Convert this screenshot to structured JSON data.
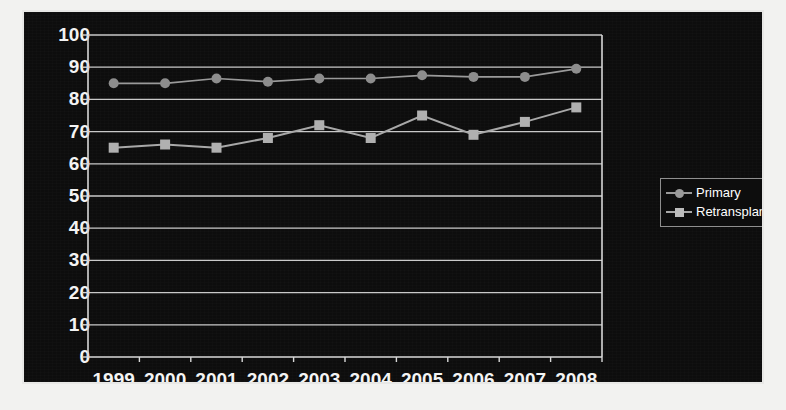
{
  "chart_data": {
    "type": "line",
    "title": "",
    "subtitle": "",
    "xlabel": "",
    "ylabel": "",
    "categories": [
      "1999",
      "2000",
      "2001",
      "2002",
      "2003",
      "2004",
      "2005",
      "2006",
      "2007",
      "2008"
    ],
    "ylim": [
      0,
      100
    ],
    "yticks": [
      0,
      10,
      20,
      30,
      40,
      50,
      60,
      70,
      80,
      90,
      100
    ],
    "grid": true,
    "grid_axis": "y",
    "legend_position": "right",
    "series": [
      {
        "name": "Primary",
        "marker": "circle",
        "color": "#9a9a9a",
        "values": [
          85,
          85,
          86.5,
          85.5,
          86.5,
          86.5,
          87.5,
          87,
          87,
          89.5
        ]
      },
      {
        "name": "Retransplant",
        "marker": "square",
        "color": "#a8a8a8",
        "values": [
          65,
          66,
          65,
          68,
          72,
          68,
          75,
          69,
          73,
          77.5
        ]
      }
    ]
  },
  "legend": {
    "items": [
      {
        "label": "Primary",
        "marker": "circle",
        "color": "#9a9a9a"
      },
      {
        "label": "Retransplant",
        "marker": "square",
        "color": "#a8a8a8"
      }
    ]
  },
  "axes": {
    "y_tick_labels": [
      "100",
      "90",
      "80",
      "70",
      "60",
      "50",
      "40",
      "30",
      "20",
      "10",
      "0"
    ],
    "x_tick_labels": [
      "1999",
      "2000",
      "2001",
      "2002",
      "2003",
      "2004",
      "2005",
      "2006",
      "2007",
      "2008"
    ]
  },
  "colors": {
    "plot_background": "#0d0d0d",
    "page_background": "#f2f2f0",
    "axis": "#d8d8d8",
    "gridline": "#c9c9c9",
    "text": "#f4f4f4",
    "primary_series": "#9a9a9a",
    "retransplant_series": "#a8a8a8"
  }
}
